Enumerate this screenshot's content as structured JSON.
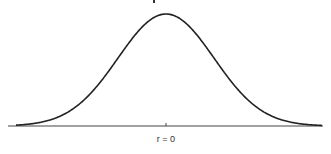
{
  "chart_data": {
    "type": "line",
    "title": "",
    "xlabel": "",
    "ylabel": "",
    "grid": false,
    "legend": null,
    "curve": "normal distribution (bell curve)",
    "x_ticks": [
      {
        "value": 0,
        "label": "r = 0"
      }
    ],
    "distribution": {
      "mean": 0,
      "sd": 1
    },
    "xlim": [
      -3.3,
      3.3
    ],
    "x": [
      -3.2,
      -2.8,
      -2.4,
      -2.0,
      -1.6,
      -1.2,
      -0.8,
      -0.4,
      0.0,
      0.4,
      0.8,
      1.2,
      1.6,
      2.0,
      2.4,
      2.8,
      3.2
    ],
    "values": [
      0.0024,
      0.0079,
      0.0224,
      0.054,
      0.1109,
      0.1942,
      0.2897,
      0.3683,
      0.3989,
      0.3683,
      0.2897,
      0.1942,
      0.1109,
      0.054,
      0.0224,
      0.0079,
      0.0024
    ]
  },
  "labels": {
    "center_tick": "r = 0"
  },
  "colors": {
    "curve": "#222222",
    "axis": "#444444",
    "background": "#ffffff"
  }
}
